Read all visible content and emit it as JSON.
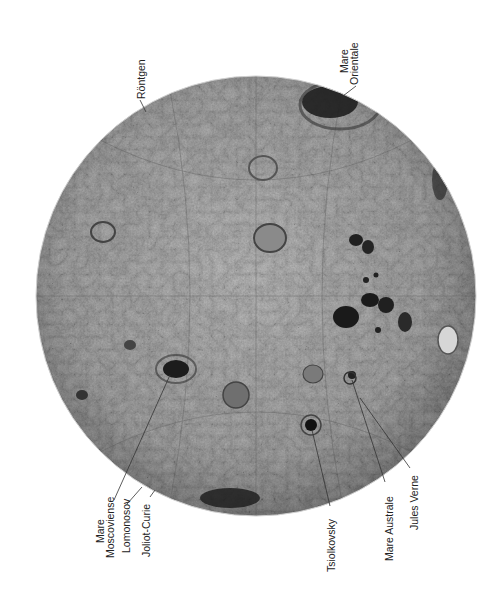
{
  "map": {
    "subject": "Far side of the Moon",
    "style": "grayscale shaded-relief globe",
    "colors": {
      "background": "#ffffff",
      "surface_light": "#c9c9c9",
      "surface_mid": "#9a9a9a",
      "surface_dark": "#2a2a2a",
      "label_text": "#222222"
    },
    "labels": [
      {
        "id": "rontgen",
        "lines": [
          "Röntgen"
        ]
      },
      {
        "id": "mare-orientale",
        "lines": [
          "Mare",
          "Orientale"
        ]
      },
      {
        "id": "mare-moscoviense",
        "lines": [
          "Mare",
          "Moscoviense"
        ]
      },
      {
        "id": "lomonosov",
        "lines": [
          "Lomonosov"
        ]
      },
      {
        "id": "joliot-curie",
        "lines": [
          "Joliot-Curie"
        ]
      },
      {
        "id": "tsiolkovsky",
        "lines": [
          "Tsiolkovsky"
        ]
      },
      {
        "id": "mare-australe",
        "lines": [
          "Mare Australe"
        ]
      },
      {
        "id": "jules-verne",
        "lines": [
          "Jules Verne"
        ]
      }
    ]
  }
}
